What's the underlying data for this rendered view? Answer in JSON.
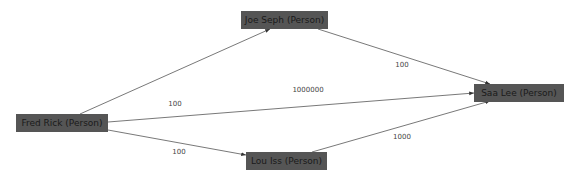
{
  "graph": {
    "colors": {
      "node_fill": "#555555",
      "node_text": "#1a1a1a",
      "edge": "#444444",
      "label": "#444444",
      "background": "#ffffff"
    },
    "nodes": [
      {
        "id": "fred",
        "label": "Fred Rick (Person)"
      },
      {
        "id": "joe",
        "label": "Joe Seph (Person)"
      },
      {
        "id": "saa",
        "label": "Saa Lee (Person)"
      },
      {
        "id": "lou",
        "label": "Lou Iss (Person)"
      }
    ],
    "edges": [
      {
        "from": "fred",
        "to": "joe",
        "label": "100"
      },
      {
        "from": "fred",
        "to": "saa",
        "label": "1000000"
      },
      {
        "from": "fred",
        "to": "lou",
        "label": "100"
      },
      {
        "from": "joe",
        "to": "saa",
        "label": "100"
      },
      {
        "from": "lou",
        "to": "saa",
        "label": "1000"
      }
    ]
  }
}
